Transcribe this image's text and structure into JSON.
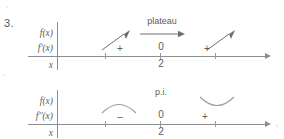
{
  "problem": {
    "number": "3."
  },
  "charts": [
    {
      "id": "chart-0",
      "labels": {
        "function": "f(x)",
        "derivative": "f'(x)",
        "variable": "x"
      },
      "annotation": {
        "text": "plateau",
        "kind": "horizontal-arrow",
        "x_pct": 57
      },
      "critical_point": {
        "x_pct": 57,
        "derivative_value": "0",
        "x_value": "2"
      },
      "intervals": [
        {
          "sign": "+",
          "x_pct": 36,
          "behavior": "increasing"
        },
        {
          "sign": "+",
          "x_pct": 78,
          "behavior": "increasing"
        }
      ],
      "ticks_pct": [
        32,
        57,
        82
      ]
    },
    {
      "id": "chart-1",
      "labels": {
        "function": "f(x)",
        "derivative": "f''(x)",
        "variable": "x"
      },
      "annotation": {
        "text": "p.i.",
        "kind": "none",
        "x_pct": 57
      },
      "critical_point": {
        "x_pct": 57,
        "derivative_value": "0",
        "x_value": "2"
      },
      "intervals": [
        {
          "sign": "–",
          "x_pct": 36,
          "behavior": "concave-down"
        },
        {
          "sign": "+",
          "x_pct": 78,
          "behavior": "concave-up"
        }
      ],
      "ticks_pct": [
        32,
        57,
        82
      ]
    }
  ],
  "colors": {
    "ink": "#5d5d5d",
    "line": "#8e8e8e",
    "glyph": "#6e6e6e",
    "arc": "#9b9b9b",
    "background": "#ffffff"
  }
}
